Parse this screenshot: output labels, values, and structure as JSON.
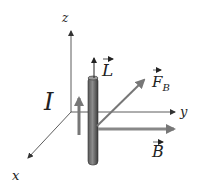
{
  "diagram": {
    "axes": {
      "x_label": "x",
      "y_label": "y",
      "z_label": "z"
    },
    "vectors": {
      "current_label": "I",
      "length_label": "L",
      "force_label": "F",
      "force_subscript": "B",
      "field_label": "B"
    },
    "colors": {
      "axis": "#333333",
      "rod_dark": "#4a4a4a",
      "rod_light": "#8a8a8a",
      "vector_gray": "#7a7a7a",
      "text": "#222222"
    }
  }
}
